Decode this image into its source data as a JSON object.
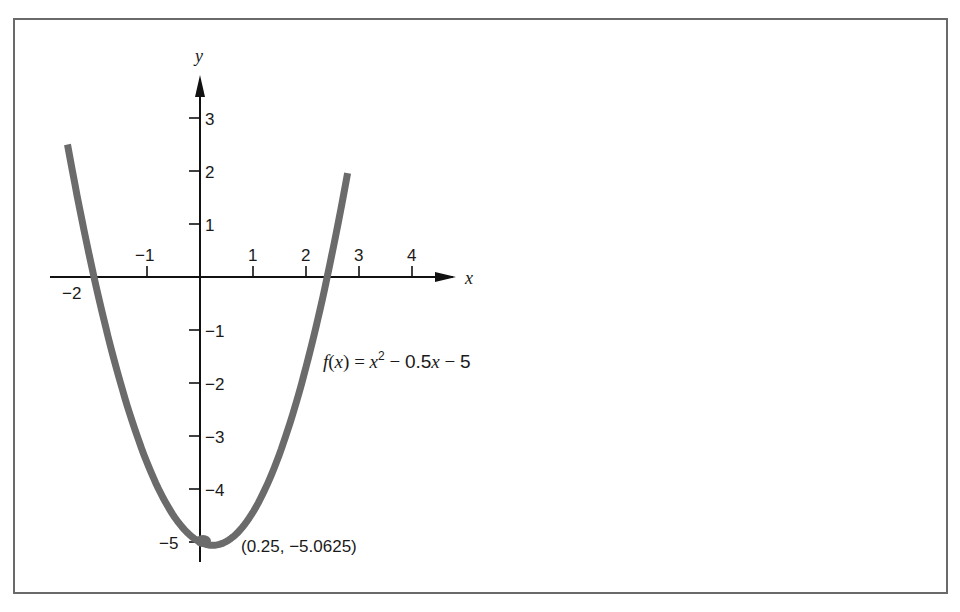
{
  "chart_data": {
    "type": "line",
    "title": "",
    "function_label": {
      "lhs": "f(x)",
      "equals": "=",
      "parts": [
        "x",
        "2",
        " − 0.5",
        "x",
        " − 5"
      ],
      "full": "f(x) = x² − 0.5x − 5"
    },
    "xlabel": "x",
    "ylabel": "y",
    "x_ticks": [
      -2,
      -1,
      1,
      2,
      3,
      4
    ],
    "x_tick_labels": [
      "−2",
      "−1",
      "1",
      "2",
      "3",
      "4"
    ],
    "y_ticks": [
      3,
      2,
      1,
      -1,
      -2,
      -3,
      -4,
      -5
    ],
    "y_tick_labels": [
      "3",
      "2",
      "1",
      "−1",
      "−2",
      "−3",
      "−4",
      "−5"
    ],
    "xlim": [
      -2.8,
      4.9
    ],
    "ylim": [
      -5.5,
      3.8
    ],
    "grid": false,
    "legend": "none",
    "series": [
      {
        "name": "f(x) = x^2 - 0.5x - 5",
        "coefficients": {
          "a": 1,
          "b": -0.5,
          "c": -5
        },
        "x_range": [
          -2.5,
          2.9
        ],
        "x": [
          -2.5,
          -2,
          -1.5,
          -1,
          -0.5,
          0,
          0.25,
          0.5,
          1,
          1.5,
          2,
          2.5,
          2.9
        ],
        "values": [
          2.5,
          0,
          -1.0,
          -3.5,
          -4.5,
          -5.0,
          -5.0625,
          -5.0,
          -4.5,
          -3.5,
          -2.0,
          0.0,
          1.96
        ]
      }
    ],
    "annotations": [
      {
        "text": "(0.25, −5.0625)",
        "x": 0.25,
        "y": -5.0625,
        "kind": "vertex"
      },
      {
        "text": "f(x) = x² − 0.5x − 5",
        "kind": "equation"
      }
    ],
    "roots": [
      -2,
      2.5
    ],
    "vertex": {
      "x": 0.25,
      "y": -5.0625
    }
  },
  "labels": {
    "x_axis": "x",
    "y_axis": "y",
    "vertex": "(0.25, −5.0625)",
    "eq_f": "f",
    "eq_paren_open": "(",
    "eq_var": "x",
    "eq_paren_close": ")",
    "eq_equals": " = ",
    "eq_x": "x",
    "eq_exp": "2",
    "eq_minus1": " − ",
    "eq_coef": "0.5",
    "eq_x2": "x",
    "eq_minus2": " − ",
    "eq_const": "5"
  },
  "colors": {
    "curve": "#6b6b6b",
    "axis": "#111111",
    "frame": "#6a6a6a",
    "background": "#ffffff"
  }
}
